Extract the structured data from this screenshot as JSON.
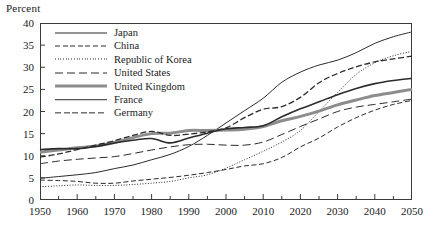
{
  "axis": {
    "ylabel": "Percent",
    "yticks": [
      0,
      5,
      10,
      15,
      20,
      25,
      30,
      35,
      40
    ],
    "xticks": [
      1950,
      1960,
      1970,
      1980,
      1990,
      2000,
      2010,
      2020,
      2030,
      2040,
      2050
    ],
    "xminor": [
      1955,
      1965,
      1975,
      1985,
      1995,
      2005,
      2015,
      2025,
      2035,
      2045
    ]
  },
  "chart_data": {
    "type": "line",
    "title": "",
    "xlabel": "",
    "ylabel": "Percent",
    "xlim": [
      1950,
      2050
    ],
    "ylim": [
      0,
      40
    ],
    "grid": false,
    "legend_position": "upper-left-inside",
    "x": [
      1950,
      1955,
      1960,
      1965,
      1970,
      1975,
      1980,
      1985,
      1990,
      1995,
      2000,
      2005,
      2010,
      2015,
      2020,
      2025,
      2030,
      2035,
      2040,
      2045,
      2050
    ],
    "series": [
      {
        "name": "Japan",
        "style": "solid",
        "color": "#2b2b2b",
        "width": 1.0,
        "values": [
          4.9,
          5.3,
          5.7,
          6.2,
          7.1,
          7.9,
          9.1,
          10.3,
          12.1,
          14.6,
          17.4,
          20.2,
          23.0,
          26.6,
          28.9,
          30.5,
          31.6,
          33.3,
          35.4,
          36.9,
          38.0
        ]
      },
      {
        "name": "China",
        "style": "dashed",
        "color": "#2b2b2b",
        "width": 1.0,
        "values": [
          4.5,
          4.4,
          4.2,
          3.8,
          3.8,
          4.3,
          4.7,
          5.1,
          5.6,
          6.2,
          6.9,
          7.7,
          8.2,
          9.6,
          12.0,
          14.0,
          16.5,
          18.6,
          20.3,
          21.6,
          22.5
        ]
      },
      {
        "name": "Republic of Korea",
        "style": "dotted",
        "color": "#2b2b2b",
        "width": 1.0,
        "values": [
          3.0,
          3.2,
          3.4,
          3.3,
          3.3,
          3.5,
          3.8,
          4.2,
          5.0,
          5.7,
          7.2,
          9.1,
          11.0,
          13.1,
          15.7,
          20.0,
          24.3,
          28.4,
          31.0,
          32.6,
          33.6
        ]
      },
      {
        "name": "United States",
        "style": "longdash",
        "color": "#2b2b2b",
        "width": 1.0,
        "values": [
          8.2,
          8.8,
          9.2,
          9.5,
          9.8,
          10.5,
          11.3,
          12.0,
          12.5,
          12.6,
          12.4,
          12.4,
          13.1,
          14.8,
          16.6,
          18.3,
          20.0,
          21.0,
          21.6,
          22.2,
          22.8
        ]
      },
      {
        "name": "United Kingdom",
        "style": "thick",
        "color": "#8d8d8d",
        "width": 3.0,
        "values": [
          10.8,
          11.3,
          11.8,
          12.2,
          13.0,
          14.1,
          15.0,
          15.1,
          15.7,
          15.7,
          15.8,
          16.0,
          16.6,
          17.9,
          18.9,
          20.1,
          21.5,
          22.6,
          23.6,
          24.3,
          25.0
        ]
      },
      {
        "name": "France",
        "style": "solid",
        "color": "#2b2b2b",
        "width": 1.6,
        "values": [
          11.4,
          11.6,
          11.6,
          12.1,
          12.9,
          13.5,
          13.9,
          12.9,
          14.0,
          15.1,
          16.1,
          16.4,
          16.8,
          18.8,
          20.6,
          22.2,
          23.8,
          25.2,
          26.3,
          27.0,
          27.5
        ]
      },
      {
        "name": "Germany",
        "style": "dashed",
        "color": "#2b2b2b",
        "width": 1.3,
        "values": [
          9.7,
          10.4,
          11.4,
          12.4,
          13.4,
          14.6,
          15.5,
          14.6,
          14.9,
          15.4,
          16.3,
          18.6,
          20.5,
          21.1,
          23.2,
          26.5,
          28.6,
          30.1,
          31.2,
          31.9,
          32.5
        ]
      }
    ]
  },
  "legend": {
    "items": [
      {
        "label": "Japan",
        "key": "solid-thin"
      },
      {
        "label": "China",
        "key": "dashed"
      },
      {
        "label": "Republic of Korea",
        "key": "dotted"
      },
      {
        "label": "United States",
        "key": "longdash"
      },
      {
        "label": "United Kingdom",
        "key": "thick-gray"
      },
      {
        "label": "France",
        "key": "solid-medium"
      },
      {
        "label": "Germany",
        "key": "dashed-medium"
      }
    ]
  }
}
